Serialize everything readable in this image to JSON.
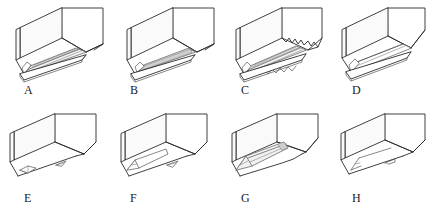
{
  "figure": {
    "background_color": "#ffffff",
    "line_color": "#2b2b2b",
    "rows": [
      {
        "name": "top-row",
        "cells": [
          {
            "label": "A",
            "name": "block-a",
            "detail": "block with wide multi-ridged V groove and stepped base flange"
          },
          {
            "label": "B",
            "name": "block-b",
            "detail": "block with narrow deep straight groove and base flange"
          },
          {
            "label": "C",
            "name": "block-c",
            "detail": "block with serrated jagged ridged groove and base flange"
          },
          {
            "label": "D",
            "name": "block-d",
            "detail": "block with plain smooth chamfered channel and base flange"
          }
        ]
      },
      {
        "name": "bottom-row",
        "cells": [
          {
            "label": "E",
            "name": "block-e",
            "detail": "block with small short wedge tip and flat lower face"
          },
          {
            "label": "F",
            "name": "block-f",
            "detail": "block with tapered pointed conical tip"
          },
          {
            "label": "G",
            "name": "block-g",
            "detail": "block with long sharpened pencil-like ridged point"
          },
          {
            "label": "H",
            "name": "block-h",
            "detail": "block with blunt angled wedge end"
          }
        ]
      }
    ]
  }
}
